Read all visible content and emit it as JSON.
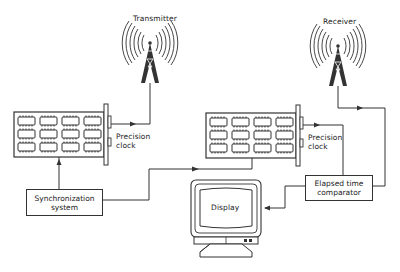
{
  "diagram": {
    "type": "block-diagram",
    "title": "",
    "nodes": {
      "transmitter": {
        "label": "Transmitter",
        "kind": "radio-tower-icon"
      },
      "receiver": {
        "label": "Receiver",
        "kind": "radio-tower-icon"
      },
      "clock_tx": {
        "label_line1": "Precision",
        "label_line2": "clock",
        "kind": "circuit-board-icon"
      },
      "clock_rx": {
        "label_line1": "Precision",
        "label_line2": "clock",
        "kind": "circuit-board-icon"
      },
      "sync": {
        "label_line1": "Synchronization",
        "label_line2": "system",
        "kind": "box"
      },
      "comparator": {
        "label_line1": "Elapsed time",
        "label_line2": "comparator",
        "kind": "box"
      },
      "display": {
        "label": "Display",
        "kind": "monitor-icon"
      }
    },
    "edges": [
      {
        "from": "sync",
        "to": "clock_tx"
      },
      {
        "from": "sync",
        "to": "clock_rx"
      },
      {
        "from": "clock_tx",
        "to": "transmitter"
      },
      {
        "from": "receiver",
        "to": "comparator"
      },
      {
        "from": "clock_rx",
        "to": "comparator"
      },
      {
        "from": "comparator",
        "to": "display"
      }
    ],
    "colors": {
      "stroke": "#333333",
      "background": "#ffffff"
    }
  }
}
